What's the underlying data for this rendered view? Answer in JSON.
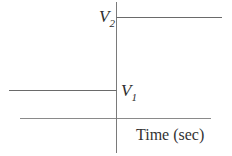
{
  "diagram": {
    "type": "step-function",
    "labels": {
      "upper_level": {
        "main": "V",
        "sub": "2"
      },
      "lower_level": {
        "main": "V",
        "sub": "1"
      },
      "x_axis": "Time (sec)"
    },
    "colors": {
      "step_line": "#6a6a6a",
      "axis_line": "#8a8a8a",
      "text": "#2e2e2e"
    },
    "geometry": {
      "vertical_axis_x": 116,
      "vertical_axis_top": 2,
      "vertical_axis_bottom": 153,
      "horizontal_axis_y": 118,
      "horizontal_axis_x1": 20,
      "horizontal_axis_x2": 211,
      "upper_level_y": 17,
      "upper_level_x2": 222,
      "lower_level_y": 90,
      "lower_level_x1": 9
    }
  }
}
